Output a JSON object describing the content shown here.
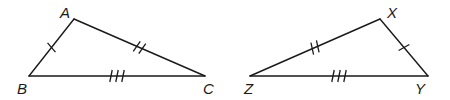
{
  "diagram": {
    "triangles": [
      {
        "name": "ABC",
        "vertices": {
          "A": {
            "label": "A",
            "x": 74,
            "y": 19,
            "label_x": 60,
            "label_y": 18
          },
          "B": {
            "label": "B",
            "x": 29,
            "y": 76,
            "label_x": 17,
            "label_y": 94
          },
          "C": {
            "label": "C",
            "x": 205,
            "y": 76,
            "label_x": 203,
            "label_y": 94
          }
        },
        "sides": [
          {
            "from": "A",
            "to": "B",
            "ticks": 1
          },
          {
            "from": "A",
            "to": "C",
            "ticks": 2
          },
          {
            "from": "B",
            "to": "C",
            "ticks": 3
          }
        ]
      },
      {
        "name": "XYZ",
        "vertices": {
          "X": {
            "label": "X",
            "x": 380,
            "y": 19,
            "label_x": 387,
            "label_y": 18
          },
          "Y": {
            "label": "Y",
            "x": 428,
            "y": 76,
            "label_x": 415,
            "label_y": 94
          },
          "Z": {
            "label": "Z",
            "x": 250,
            "y": 76,
            "label_x": 244,
            "label_y": 94
          }
        },
        "sides": [
          {
            "from": "X",
            "to": "Y",
            "ticks": 1
          },
          {
            "from": "X",
            "to": "Z",
            "ticks": 2
          },
          {
            "from": "Z",
            "to": "Y",
            "ticks": 3
          }
        ]
      }
    ],
    "stroke_color": "#1a1a1a",
    "background": "#ffffff"
  }
}
